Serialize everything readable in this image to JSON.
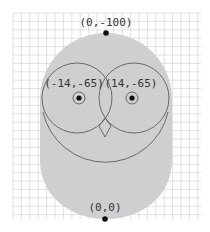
{
  "diagram": {
    "colors": {
      "background": "#ffffff",
      "grid": "#d9d9d9",
      "body_fill": "#cfcfcf",
      "outline": "#666666",
      "dot": "#111111",
      "label": "#333333"
    },
    "grid": {
      "x0": 13,
      "y0": 13,
      "x1": 201,
      "y1": 219,
      "step": 8.4
    },
    "points": [
      {
        "id": "top",
        "label": "(0,-100)",
        "x": 0,
        "y": -100
      },
      {
        "id": "left-eye",
        "label": "(-14,-65)",
        "x": -14,
        "y": -65
      },
      {
        "id": "right-eye",
        "label": "(14,-65)",
        "x": 14,
        "y": -65
      },
      {
        "id": "origin",
        "label": "(0,0)",
        "x": 0,
        "y": 0
      }
    ],
    "labels": {
      "top": "(0,-100)",
      "left_eye": "(-14,-65)",
      "right_eye": "(14,-65)",
      "origin": "(0,0)"
    }
  }
}
